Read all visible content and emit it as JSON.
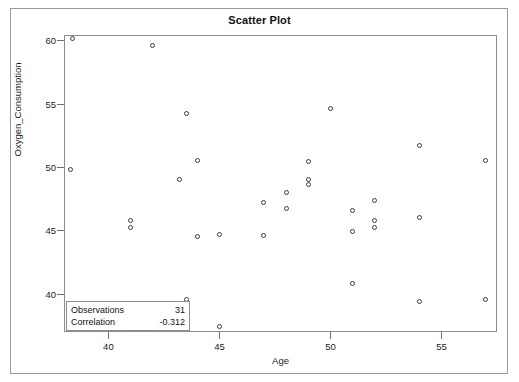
{
  "chart_data": {
    "type": "scatter",
    "title": "Scatter Plot",
    "xlabel": "Age",
    "ylabel": "Oxygen_Consumption",
    "xlim": [
      38.0,
      57.5
    ],
    "ylim": [
      37.0,
      60.4
    ],
    "xticks": [
      40,
      45,
      50,
      55
    ],
    "yticks": [
      40,
      45,
      50,
      55,
      60
    ],
    "grid": false,
    "legend": "none",
    "marker": "open-circle",
    "marker_color": "#3a3a4a",
    "points": [
      {
        "x": 38.4,
        "y": 60.1
      },
      {
        "x": 42.0,
        "y": 59.6
      },
      {
        "x": 43.5,
        "y": 54.2
      },
      {
        "x": 50.0,
        "y": 54.6
      },
      {
        "x": 54.0,
        "y": 51.7
      },
      {
        "x": 44.0,
        "y": 50.5
      },
      {
        "x": 49.0,
        "y": 50.4
      },
      {
        "x": 57.0,
        "y": 50.5
      },
      {
        "x": 38.3,
        "y": 49.8
      },
      {
        "x": 43.2,
        "y": 49.0
      },
      {
        "x": 49.0,
        "y": 49.0
      },
      {
        "x": 49.0,
        "y": 48.6
      },
      {
        "x": 48.0,
        "y": 48.0
      },
      {
        "x": 47.0,
        "y": 47.2
      },
      {
        "x": 52.0,
        "y": 47.4
      },
      {
        "x": 48.0,
        "y": 46.7
      },
      {
        "x": 51.0,
        "y": 46.6
      },
      {
        "x": 54.0,
        "y": 46.0
      },
      {
        "x": 41.0,
        "y": 45.8
      },
      {
        "x": 52.0,
        "y": 45.8
      },
      {
        "x": 41.0,
        "y": 45.2
      },
      {
        "x": 52.0,
        "y": 45.2
      },
      {
        "x": 51.0,
        "y": 44.9
      },
      {
        "x": 44.0,
        "y": 44.5
      },
      {
        "x": 45.0,
        "y": 44.7
      },
      {
        "x": 47.0,
        "y": 44.6
      },
      {
        "x": 51.0,
        "y": 40.8
      },
      {
        "x": 43.5,
        "y": 39.6
      },
      {
        "x": 54.0,
        "y": 39.4
      },
      {
        "x": 57.0,
        "y": 39.6
      },
      {
        "x": 45.0,
        "y": 37.4
      }
    ]
  },
  "stats": {
    "observations_label": "Observations",
    "observations_value": "31",
    "correlation_label": "Correlation",
    "correlation_value": "-0.312"
  }
}
